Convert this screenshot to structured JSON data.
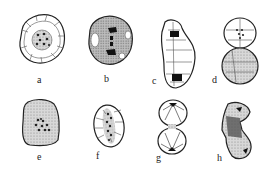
{
  "figure": {
    "panels": [
      {
        "id": "a",
        "label": "a",
        "description": "round cell, nucleus with dark chromosome dots, radial cytoplasm strands"
      },
      {
        "id": "b",
        "label": "b",
        "description": "stippled round cell, chromosomes aligned in vertical band"
      },
      {
        "id": "c",
        "label": "c",
        "description": "elongated cell, two dark chromatin masses at poles"
      },
      {
        "id": "d",
        "label": "d",
        "description": "two daughter cells, upper with dotted nucleus"
      },
      {
        "id": "e",
        "label": "e",
        "description": "stippled irregular cell, scattered chromosome dots"
      },
      {
        "id": "f",
        "label": "f",
        "description": "oval cell, chromosomes in column, radial strands"
      },
      {
        "id": "g",
        "label": "g",
        "description": "two daughter cells joined, dark spots at outer poles"
      },
      {
        "id": "h",
        "label": "h",
        "description": "irregular divided cell, dark middle region"
      }
    ],
    "colors": {
      "ink": "#222222",
      "stipple": "#b8b8b8",
      "background": "#ffffff"
    }
  }
}
